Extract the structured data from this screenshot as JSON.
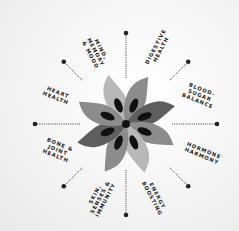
{
  "diagram": {
    "title": "",
    "center": {
      "x": 126,
      "y": 124
    },
    "colors": {
      "petal_light": "#b8b8b8",
      "petal_mid": "#8c8c8c",
      "petal_dark": "#5e5e5e",
      "seed": "#111111",
      "spoke": "#222222",
      "text": "#1c1c1c"
    },
    "spokes": [
      {
        "angle": -90
      },
      {
        "angle": -45
      },
      {
        "angle": 0
      },
      {
        "angle": 45
      },
      {
        "angle": 90
      },
      {
        "angle": 135
      },
      {
        "angle": 180
      },
      {
        "angle": -135
      }
    ],
    "labels": [
      {
        "text": "MIND,\nMEMORY\n& MOOD",
        "x": 96,
        "y": 52,
        "rotate": 62
      },
      {
        "text": "DIGESTIVE\nHEALTH",
        "x": 158,
        "y": 48,
        "rotate": -62
      },
      {
        "text": "BLOOD-\nSUGAR\nBALANCE",
        "x": 200,
        "y": 95,
        "rotate": 22
      },
      {
        "text": "HORMONE\nHARMONY",
        "x": 203,
        "y": 153,
        "rotate": 22
      },
      {
        "text": "ENERGY\nBOOSTING",
        "x": 155,
        "y": 197,
        "rotate": 62
      },
      {
        "text": "SKIN,\nSENSES &\nIMMUNITY",
        "x": 100,
        "y": 197,
        "rotate": -62
      },
      {
        "text": "BONE &\nJOINT\nHEALTH",
        "x": 58,
        "y": 150,
        "rotate": 22
      },
      {
        "text": "HEART\nHEALTH",
        "x": 57,
        "y": 95,
        "rotate": 22
      }
    ]
  }
}
